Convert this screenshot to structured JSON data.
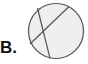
{
  "option_label": "B.",
  "diagram": {
    "shape": "circle",
    "fill": "#efefef",
    "stroke": "#555555",
    "chords": 2
  }
}
